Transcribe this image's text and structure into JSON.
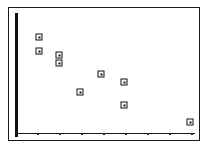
{
  "figure": {
    "background_color": "#ffffff",
    "frame_color": "#1a1a1a",
    "axis_color": "#111111",
    "marker_color": "#111111",
    "marker_shape": "open-square-with-center-dot"
  },
  "chart_data": {
    "type": "scatter",
    "title": "",
    "subtitle": "",
    "xlabel": "",
    "ylabel": "",
    "grid": false,
    "legend": null,
    "annotations": [],
    "xlim": [
      0,
      8.5
    ],
    "ylim": [
      0,
      10
    ],
    "xticklabels": [
      "",
      "",
      "",
      "",
      "",
      "",
      "",
      ""
    ],
    "yticklabels": [],
    "xticks": [
      1,
      2,
      3,
      4,
      5,
      6,
      7,
      8
    ],
    "yticks": [],
    "series": [
      {
        "name": "",
        "points": [
          {
            "x": 1.0,
            "y": 8.8,
            "px": 30,
            "py": 29
          },
          {
            "x": 1.0,
            "y": 7.4,
            "px": 30,
            "py": 43
          },
          {
            "x": 1.65,
            "y": 6.9,
            "px": 50,
            "py": 47
          },
          {
            "x": 1.65,
            "y": 6.2,
            "px": 50,
            "py": 55
          },
          {
            "x": 3.55,
            "y": 5.0,
            "px": 92,
            "py": 66
          },
          {
            "x": 4.65,
            "y": 4.4,
            "px": 115,
            "py": 74
          },
          {
            "x": 2.65,
            "y": 3.6,
            "px": 71,
            "py": 84
          },
          {
            "x": 4.65,
            "y": 2.8,
            "px": 115,
            "py": 97
          },
          {
            "x": 7.85,
            "y": 1.4,
            "px": 181,
            "py": 114
          }
        ]
      }
    ],
    "xtick_pixels": [
      29,
      51,
      73,
      95,
      117,
      139,
      161,
      183
    ]
  }
}
